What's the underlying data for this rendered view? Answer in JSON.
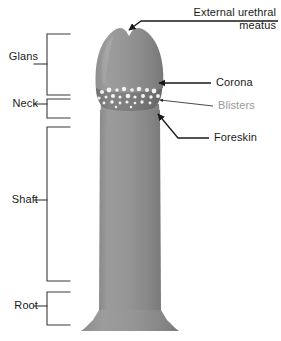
{
  "figure": {
    "background_color": "#ffffff",
    "width": 281,
    "height": 341
  },
  "colors": {
    "body_light": "#9a9a9a",
    "body_mid": "#8d8d8d",
    "body_dark": "#7c7c7c",
    "body_edge": "#6f6f6f",
    "corona_band": "#7a7a7a",
    "blister_fill": "#f2f2f2",
    "leader_line": "#1a1a1a",
    "bracket_line": "#3a3a3a",
    "text_black": "#1a1a1a",
    "text_gray": "#9a9a9a"
  },
  "brackets": [
    {
      "id": "glans",
      "label": "Glans",
      "label_x": 8,
      "label_y": 57,
      "tick_y": 64,
      "top_y": 34,
      "bottom_y": 95,
      "spine_x": 47,
      "arm_x": 70
    },
    {
      "id": "neck",
      "label": "Neck",
      "label_x": 8,
      "label_y": 97,
      "tick_y": 104,
      "top_y": 99,
      "bottom_y": 118,
      "spine_x": 47,
      "arm_x": 70
    },
    {
      "id": "shaft",
      "label": "Shaft",
      "label_x": 8,
      "label_y": 193,
      "tick_y": 200,
      "top_y": 127,
      "bottom_y": 281,
      "spine_x": 47,
      "arm_x": 70
    },
    {
      "id": "root",
      "label": "Root",
      "label_x": 8,
      "label_y": 299,
      "tick_y": 306,
      "top_y": 292,
      "bottom_y": 325,
      "spine_x": 47,
      "arm_x": 70
    }
  ],
  "callouts": [
    {
      "id": "meatus",
      "label": "External urethral meatus",
      "label_lines": [
        "External urethral",
        "meatus"
      ],
      "text_color": "#1a1a1a",
      "label_x": 192,
      "label_y": 6,
      "arrow_tip_x": 127,
      "arrow_tip_y": 31,
      "elbow_x": 141,
      "elbow_y": 21,
      "line_end_x": 278,
      "line_end_y": 21
    },
    {
      "id": "corona",
      "label": "Corona",
      "text_color": "#1a1a1a",
      "label_x": 216,
      "label_y": 76,
      "arrow_tip_x": 156,
      "arrow_tip_y": 83,
      "line_end_x": 211,
      "line_end_y": 83
    },
    {
      "id": "blisters",
      "label": "Blisters",
      "text_color": "#9a9a9a",
      "label_x": 218,
      "label_y": 95,
      "arrow_tip_x": 154,
      "arrow_tip_y": 101,
      "line_end_x": 213,
      "line_end_y": 106
    },
    {
      "id": "foreskin",
      "label": "Foreskin",
      "text_color": "#1a1a1a",
      "label_x": 214,
      "label_y": 131,
      "arrow_tip_x": 156,
      "arrow_tip_y": 113,
      "elbow_x": 178,
      "elbow_y": 138,
      "line_end_x": 209,
      "line_end_y": 138
    }
  ],
  "anatomy": {
    "glans": {
      "top_y": 27,
      "bottom_y": 86,
      "left_x": 96,
      "right_x": 162,
      "apex_notch": true
    },
    "corona_band": {
      "top_y": 83,
      "bottom_y": 108,
      "left_x": 95,
      "right_x": 163
    },
    "neck": {
      "top_y": 106,
      "bottom_y": 120,
      "left_x": 101,
      "right_x": 157
    },
    "shaft": {
      "top_y": 118,
      "bottom_y": 312,
      "left_x": 100,
      "right_x": 160
    },
    "root_base": {
      "top_y": 310,
      "bottom_y": 332,
      "left_x": 80,
      "right_x": 180
    }
  },
  "blisters": {
    "count": 26,
    "fill": "#f2f2f2",
    "dots": [
      {
        "cx": 102,
        "cy": 92,
        "r": 2.0
      },
      {
        "cx": 109,
        "cy": 90,
        "r": 2.4
      },
      {
        "cx": 117,
        "cy": 90,
        "r": 1.7
      },
      {
        "cx": 124,
        "cy": 89,
        "r": 2.2
      },
      {
        "cx": 132,
        "cy": 90,
        "r": 1.8
      },
      {
        "cx": 139,
        "cy": 89,
        "r": 2.3
      },
      {
        "cx": 147,
        "cy": 90,
        "r": 2.0
      },
      {
        "cx": 154,
        "cy": 91,
        "r": 2.4
      },
      {
        "cx": 99,
        "cy": 98,
        "r": 1.6
      },
      {
        "cx": 106,
        "cy": 97,
        "r": 1.5
      },
      {
        "cx": 113,
        "cy": 96,
        "r": 2.1
      },
      {
        "cx": 120,
        "cy": 97,
        "r": 1.5
      },
      {
        "cx": 128,
        "cy": 96,
        "r": 2.3
      },
      {
        "cx": 135,
        "cy": 97,
        "r": 1.6
      },
      {
        "cx": 143,
        "cy": 96,
        "r": 2.0
      },
      {
        "cx": 151,
        "cy": 97,
        "r": 1.7
      },
      {
        "cx": 158,
        "cy": 96,
        "r": 1.9
      },
      {
        "cx": 104,
        "cy": 103,
        "r": 1.4
      },
      {
        "cx": 112,
        "cy": 102,
        "r": 1.8
      },
      {
        "cx": 120,
        "cy": 103,
        "r": 1.4
      },
      {
        "cx": 127,
        "cy": 102,
        "r": 1.6
      },
      {
        "cx": 135,
        "cy": 103,
        "r": 1.3
      },
      {
        "cx": 142,
        "cy": 102,
        "r": 1.7
      },
      {
        "cx": 150,
        "cy": 103,
        "r": 1.4
      },
      {
        "cx": 116,
        "cy": 107,
        "r": 1.2
      },
      {
        "cx": 131,
        "cy": 107,
        "r": 1.2
      }
    ]
  }
}
